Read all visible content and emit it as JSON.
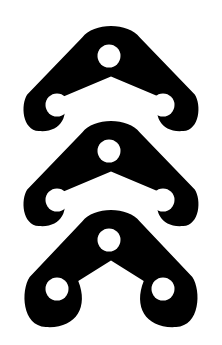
{
  "canvas": {
    "width": 222,
    "height": 345,
    "background_color": "#FFFFFF",
    "title": "Triple Chevron Mark"
  },
  "graphic": {
    "name": "triple-chevron-logo",
    "description": "Three stacked black chevron (boomerang) shapes, each with three white circular holes",
    "fill_color": "#000000",
    "hole_color": "#FFFFFF",
    "repeat_count": 3,
    "stack_offset_y": 95
  },
  "chart_data": {
    "type": "scatter",
    "xlabel": "",
    "ylabel": "",
    "xlim": [
      0,
      222
    ],
    "ylim": [
      0,
      345
    ],
    "grid": false,
    "legend": "none",
    "series": [
      {
        "name": "chevron-1",
        "apex_point": [
          111,
          41
        ],
        "left_tip": [
          36,
          114
        ],
        "right_tip": [
          186,
          114
        ],
        "arm_thickness": 48,
        "outer_top_y": 26,
        "outer_left_x": 21,
        "outer_right_x": 201,
        "outer_bottom_y": 129,
        "inner_notch_y": 98,
        "holes": [
          {
            "name": "apex-hole",
            "cx": 109,
            "cy": 56,
            "r": 11.5
          },
          {
            "name": "left-hole",
            "cx": 57,
            "cy": 105,
            "r": 11.5
          },
          {
            "name": "right-hole",
            "cx": 163,
            "cy": 105,
            "r": 11.5
          }
        ]
      },
      {
        "name": "chevron-2",
        "apex_point": [
          111,
          136
        ],
        "left_tip": [
          36,
          209
        ],
        "right_tip": [
          186,
          209
        ],
        "arm_thickness": 48,
        "outer_top_y": 121,
        "outer_left_x": 21,
        "outer_right_x": 201,
        "outer_bottom_y": 224,
        "inner_notch_y": 193,
        "holes": [
          {
            "name": "apex-hole",
            "cx": 109,
            "cy": 151,
            "r": 11.5
          },
          {
            "name": "left-hole",
            "cx": 57,
            "cy": 200,
            "r": 11.5
          },
          {
            "name": "right-hole",
            "cx": 163,
            "cy": 200,
            "r": 11.5
          }
        ]
      },
      {
        "name": "chevron-3",
        "apex_point": [
          111,
          225
        ],
        "left_tip": [
          36,
          298
        ],
        "right_tip": [
          186,
          298
        ],
        "arm_thickness": 48,
        "outer_top_y": 210,
        "outer_left_x": 21,
        "outer_right_x": 201,
        "outer_bottom_y": 325,
        "inner_notch_y": 282,
        "holes": [
          {
            "name": "apex-hole",
            "cx": 109,
            "cy": 240,
            "r": 11.5
          },
          {
            "name": "left-hole",
            "cx": 57,
            "cy": 289,
            "r": 11.5
          },
          {
            "name": "right-hole",
            "cx": 163,
            "cy": 289,
            "r": 11.5
          }
        ]
      }
    ]
  }
}
